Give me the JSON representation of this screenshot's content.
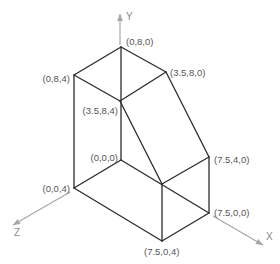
{
  "diagram": {
    "title": "",
    "colors": {
      "edge": "#2b2b2b",
      "axis": "#a6a6a6",
      "label": "#555555"
    },
    "axes": [
      {
        "name": "Y",
        "from": [
          120,
          45
        ],
        "to": [
          120,
          14
        ],
        "label_pos": [
          126,
          20
        ]
      },
      {
        "name": "Z",
        "from": [
          70,
          192
        ],
        "to": [
          13,
          225
        ],
        "label_pos": [
          14,
          236
        ]
      },
      {
        "name": "X",
        "from": [
          213,
          216
        ],
        "to": [
          263,
          245
        ],
        "label_pos": [
          266,
          240
        ]
      }
    ],
    "vertices": [
      {
        "id": "v080",
        "label": "(0,8,0)",
        "x": 121,
        "y": 47,
        "label_pos": [
          126,
          42
        ]
      },
      {
        "id": "v084",
        "label": "(0,8,4)",
        "x": 74,
        "y": 75,
        "label_pos": [
          70,
          79
        ],
        "anchor": "end"
      },
      {
        "id": "v3580",
        "label": "(3.5,8,0)",
        "x": 166,
        "y": 72,
        "label_pos": [
          170,
          73
        ]
      },
      {
        "id": "v3584",
        "label": "(3.5,8,4)",
        "x": 120,
        "y": 101,
        "label_pos": [
          118,
          111
        ],
        "anchor": "end"
      },
      {
        "id": "v000",
        "label": "(0,0,0)",
        "x": 121,
        "y": 160,
        "label_pos": [
          118,
          158
        ],
        "anchor": "end"
      },
      {
        "id": "v004",
        "label": "(0,0,4)",
        "x": 74,
        "y": 188,
        "label_pos": [
          70,
          189
        ],
        "anchor": "end"
      },
      {
        "id": "v7540",
        "label": "(7.5,4,0)",
        "x": 209,
        "y": 157,
        "label_pos": [
          214,
          160
        ]
      },
      {
        "id": "v7544",
        "label": "",
        "x": 162,
        "y": 184
      },
      {
        "id": "v7500",
        "label": "(7.5,0,0)",
        "x": 209,
        "y": 213,
        "label_pos": [
          214,
          213
        ]
      },
      {
        "id": "v7504",
        "label": "(7.5,0,4)",
        "x": 162,
        "y": 241,
        "label_pos": [
          144,
          252
        ]
      }
    ],
    "edges": [
      [
        "v080",
        "v084"
      ],
      [
        "v080",
        "v3580"
      ],
      [
        "v084",
        "v3584"
      ],
      [
        "v3584",
        "v3580"
      ],
      [
        "v080",
        "v000"
      ],
      [
        "v084",
        "v004"
      ],
      [
        "v3580",
        "v7540"
      ],
      [
        "v3584",
        "v7544"
      ],
      [
        "v7544",
        "v7540"
      ],
      [
        "v7544",
        "v7504"
      ],
      [
        "v7540",
        "v7500"
      ],
      [
        "v000",
        "v004"
      ],
      [
        "v004",
        "v7504"
      ],
      [
        "v7504",
        "v7500"
      ],
      [
        "v000",
        "v7500"
      ]
    ]
  }
}
